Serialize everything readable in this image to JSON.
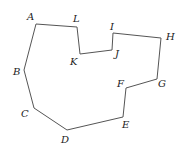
{
  "diagram": {
    "type": "polygon",
    "stroke_color": "#555555",
    "vertices": [
      {
        "name": "A",
        "x": 36,
        "y": 24,
        "lx": 27,
        "ly": 20
      },
      {
        "name": "L",
        "x": 77,
        "y": 27,
        "lx": 73,
        "ly": 22
      },
      {
        "name": "K",
        "x": 80,
        "y": 54,
        "lx": 70,
        "ly": 65
      },
      {
        "name": "J",
        "x": 112,
        "y": 50,
        "lx": 115,
        "ly": 57
      },
      {
        "name": "I",
        "x": 113,
        "y": 33,
        "lx": 110,
        "ly": 30
      },
      {
        "name": "H",
        "x": 161,
        "y": 38,
        "lx": 166,
        "ly": 40
      },
      {
        "name": "G",
        "x": 157,
        "y": 79,
        "lx": 158,
        "ly": 87
      },
      {
        "name": "F",
        "x": 126,
        "y": 88,
        "lx": 117,
        "ly": 87
      },
      {
        "name": "E",
        "x": 123,
        "y": 117,
        "lx": 122,
        "ly": 128
      },
      {
        "name": "D",
        "x": 67,
        "y": 130,
        "lx": 61,
        "ly": 143
      },
      {
        "name": "C",
        "x": 34,
        "y": 108,
        "lx": 21,
        "ly": 117
      },
      {
        "name": "B",
        "x": 24,
        "y": 70,
        "lx": 13,
        "ly": 75
      }
    ]
  }
}
